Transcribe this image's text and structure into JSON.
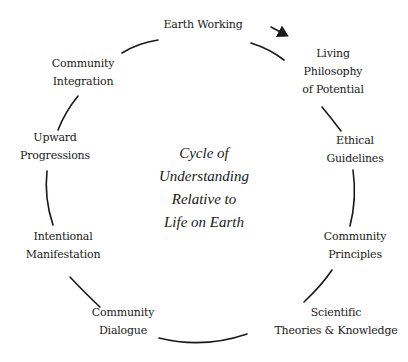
{
  "diagram": {
    "title_lines": [
      "Cycle of",
      "Understanding",
      "Relative to",
      "Life on Earth"
    ],
    "nodes": [
      {
        "id": "earth-working",
        "lines": [
          "Earth Working"
        ]
      },
      {
        "id": "living-philosophy",
        "lines": [
          "Living",
          "Philosophy",
          "of Potential"
        ]
      },
      {
        "id": "ethical-guidelines",
        "lines": [
          "Ethical",
          "Guidelines"
        ]
      },
      {
        "id": "community-principles",
        "lines": [
          "Community",
          "Principles"
        ]
      },
      {
        "id": "scientific-theories",
        "lines": [
          "Scientific",
          "Theories & Knowledge"
        ]
      },
      {
        "id": "community-dialogue",
        "lines": [
          "Community",
          "Dialogue"
        ]
      },
      {
        "id": "intentional-manifestation",
        "lines": [
          "Intentional",
          "Manifestation"
        ]
      },
      {
        "id": "upward-progressions",
        "lines": [
          "Upward",
          "Progressions"
        ]
      },
      {
        "id": "community-integration",
        "lines": [
          "Community",
          "Integration"
        ]
      }
    ],
    "direction": "clockwise",
    "colors": {
      "line": "#1a1a1a",
      "background": "#ffffff",
      "text": "#1a1a1a"
    }
  }
}
